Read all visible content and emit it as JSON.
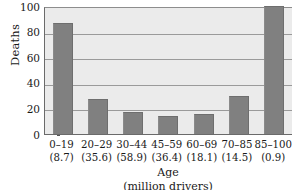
{
  "chart_data": {
    "type": "bar",
    "title": "",
    "subtitle": "",
    "xlabel": "Age",
    "xlabel_sub": "(million drivers)",
    "ylabel": "Deaths",
    "ylim": [
      0,
      100
    ],
    "yticks": [
      100,
      80,
      60,
      40,
      20,
      0
    ],
    "ytick_labels": [
      "100",
      "80",
      "60",
      "40",
      "20",
      "0"
    ],
    "grid": "horizontal",
    "legend": "none",
    "categories": [
      "0–19",
      "20–29",
      "30–44",
      "45–59",
      "60–69",
      "70–85",
      "85–100"
    ],
    "category_sublabels": [
      "(8.7)",
      "(35.6)",
      "(58.9)",
      "(36.4)",
      "(18.1)",
      "(14.5)",
      "(0.9)"
    ],
    "values": [
      87,
      27,
      17,
      14,
      16,
      30,
      100
    ],
    "bar_color": "#808080",
    "plot_background": "#ebebeb",
    "gridline_color": "#9a9a9a",
    "axis_color": "#6a6a6a"
  }
}
